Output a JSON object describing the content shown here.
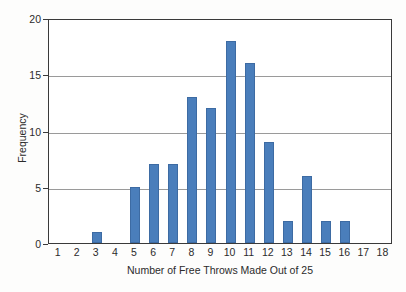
{
  "chart_data": {
    "type": "bar",
    "title": "",
    "subtitle": "",
    "xlabel": "Number of Free Throws Made Out of 25",
    "ylabel": "Frequency",
    "categories": [
      "1",
      "2",
      "3",
      "4",
      "5",
      "6",
      "7",
      "8",
      "9",
      "10",
      "11",
      "12",
      "13",
      "14",
      "15",
      "16",
      "17",
      "18"
    ],
    "values": [
      0,
      0,
      1,
      0,
      5,
      7,
      7,
      13,
      12,
      18,
      16,
      9,
      2,
      6,
      2,
      2,
      0,
      0
    ],
    "xlim": [
      0.5,
      18.5
    ],
    "ylim": [
      0,
      20
    ],
    "y_ticks": [
      0,
      5,
      10,
      15,
      20
    ],
    "y_tick_labels": [
      "0",
      "5",
      "10",
      "15",
      "20"
    ],
    "x_ticks": [
      1,
      2,
      3,
      4,
      5,
      6,
      7,
      8,
      9,
      10,
      11,
      12,
      13,
      14,
      15,
      16,
      17,
      18
    ],
    "grid": "horizontal",
    "gridlines_at": [
      5,
      10,
      15,
      20
    ],
    "legend": null,
    "legend_position": "none",
    "annotations": [],
    "bar_color": "#4a7ebb",
    "bar_edge_color": "#3d6ba3",
    "axis_color": "#3a3a3a",
    "grid_color": "#9a9a9a",
    "plot_background": "#ffffff",
    "figure_background": "#fdfdfc"
  }
}
